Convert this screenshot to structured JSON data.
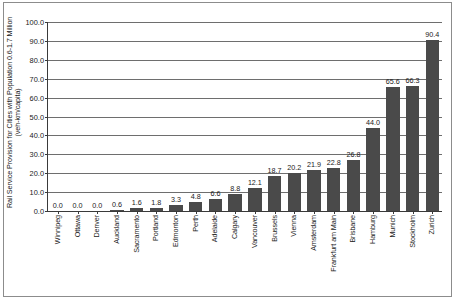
{
  "chart_data": {
    "type": "bar",
    "title": "",
    "subtitle": "",
    "xlabel": "",
    "ylabel_line1": "Rail Service Provision for Cities with Population 0.6-1.7 Million",
    "ylabel_line2": "(veh-km/capita)",
    "ylim": [
      0.0,
      100.0
    ],
    "ytick_step": 10.0,
    "ytick_labels": [
      "100.0",
      "90.0",
      "80.0",
      "70.0",
      "60.0",
      "50.0",
      "40.0",
      "30.0",
      "20.0",
      "10.0",
      "0.0"
    ],
    "ytick_values": [
      100.0,
      90.0,
      80.0,
      70.0,
      60.0,
      50.0,
      40.0,
      30.0,
      20.0,
      10.0,
      0.0
    ],
    "grid": true,
    "grid_axis": "y",
    "legend": false,
    "bar_color": "#4a4a4a",
    "axis_color": "#3a3a3a",
    "grid_color": "#6e6e6e",
    "categories": [
      "Winnipeg",
      "Ottawa",
      "Denver",
      "Auckland",
      "Sacramento",
      "Portland",
      "Edmonton",
      "Perth",
      "Adelaide",
      "Calgary",
      "Vancouver",
      "Brussels",
      "Vienna",
      "Amsterdam",
      "Frankfurt am Main",
      "Brisbane",
      "Hamburg",
      "Munich",
      "Stockholm",
      "Zurich"
    ],
    "values": [
      0.0,
      0.0,
      0.0,
      0.6,
      1.6,
      1.8,
      3.3,
      4.8,
      6.6,
      8.8,
      12.1,
      18.7,
      20.2,
      21.9,
      22.8,
      26.8,
      44.0,
      65.6,
      66.3,
      90.4
    ],
    "value_labels": [
      "0.0",
      "0.0",
      "0.0",
      "0.6",
      "1.6",
      "1.8",
      "3.3",
      "4.8",
      "6.6",
      "8.8",
      "12.1",
      "18.7",
      "20.2",
      "21.9",
      "22.8",
      "26.8",
      "44.0",
      "65.6",
      "66.3",
      "90.4"
    ]
  }
}
